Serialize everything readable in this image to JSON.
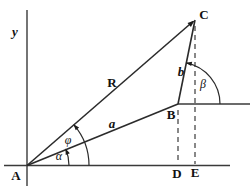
{
  "figure": {
    "background_color": "#ffffff",
    "line_color": "#2b2b2b",
    "labels": {
      "y_axis": "y",
      "point_a": "A",
      "point_b": "B",
      "point_c": "C",
      "point_d": "D",
      "point_e": "E",
      "vector_r": "R",
      "vector_a": "a",
      "vector_b": "b",
      "angle_alpha": "α",
      "angle_phi": "φ",
      "angle_beta": "β"
    }
  }
}
